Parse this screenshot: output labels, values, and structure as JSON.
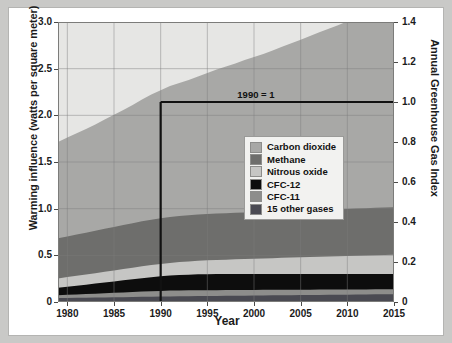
{
  "chart_data": {
    "type": "area",
    "title": "",
    "xlabel": "Year",
    "ylabel": "Warming influence (watts per square meter)",
    "ylabel_right": "Annual Greenhouse Gas Index",
    "xlim": [
      1979,
      2015
    ],
    "ylim": [
      0,
      3.0
    ],
    "ylim_right": [
      0,
      1.4
    ],
    "grid": true,
    "legend_position": "center-right",
    "stacked": true,
    "xticks": [
      1980,
      1985,
      1990,
      1995,
      2000,
      2005,
      2010,
      2015
    ],
    "xticklabels": [
      "1980",
      "1985",
      "1990",
      "1995",
      "2000",
      "2005",
      "2010",
      "2015"
    ],
    "yticks": [
      0,
      0.5,
      1.0,
      1.5,
      2.0,
      2.5,
      3.0
    ],
    "yticklabels": [
      "0",
      "0.5",
      "1.0",
      "1.5",
      "2.0",
      "2.5",
      "3.0"
    ],
    "yticks_right": [
      0,
      0.2,
      0.4,
      0.6,
      0.8,
      1.0,
      1.2,
      1.4
    ],
    "yticklabels_right": [
      "0",
      "0.2",
      "0.4",
      "0.6",
      "0.8",
      "1.0",
      "1.2",
      "1.4"
    ],
    "x": [
      1979,
      1980,
      1981,
      1982,
      1983,
      1984,
      1985,
      1986,
      1987,
      1988,
      1989,
      1990,
      1991,
      1992,
      1993,
      1994,
      1995,
      1996,
      1997,
      1998,
      1999,
      2000,
      2001,
      2002,
      2003,
      2004,
      2005,
      2006,
      2007,
      2008,
      2009,
      2010,
      2011,
      2012,
      2013,
      2014,
      2015
    ],
    "series": [
      {
        "name": "15 other gases",
        "color": "#4a4a52",
        "values": [
          0.043,
          0.044,
          0.045,
          0.046,
          0.047,
          0.049,
          0.05,
          0.052,
          0.053,
          0.055,
          0.057,
          0.058,
          0.06,
          0.061,
          0.062,
          0.063,
          0.064,
          0.065,
          0.066,
          0.067,
          0.068,
          0.069,
          0.07,
          0.071,
          0.072,
          0.073,
          0.074,
          0.075,
          0.076,
          0.077,
          0.078,
          0.079,
          0.08,
          0.081,
          0.082,
          0.083,
          0.084
        ]
      },
      {
        "name": "CFC-11",
        "color": "#8d8d8b",
        "values": [
          0.03,
          0.033,
          0.036,
          0.039,
          0.042,
          0.045,
          0.048,
          0.051,
          0.054,
          0.057,
          0.059,
          0.061,
          0.062,
          0.063,
          0.063,
          0.063,
          0.063,
          0.062,
          0.062,
          0.061,
          0.061,
          0.06,
          0.06,
          0.059,
          0.059,
          0.058,
          0.058,
          0.057,
          0.057,
          0.056,
          0.056,
          0.055,
          0.055,
          0.054,
          0.054,
          0.053,
          0.053
        ]
      },
      {
        "name": "CFC-12",
        "color": "#0d0d0d",
        "values": [
          0.08,
          0.087,
          0.094,
          0.101,
          0.108,
          0.115,
          0.122,
          0.129,
          0.136,
          0.143,
          0.15,
          0.156,
          0.161,
          0.165,
          0.168,
          0.17,
          0.171,
          0.172,
          0.172,
          0.172,
          0.172,
          0.172,
          0.171,
          0.171,
          0.17,
          0.17,
          0.169,
          0.169,
          0.168,
          0.167,
          0.167,
          0.166,
          0.165,
          0.165,
          0.164,
          0.163,
          0.162
        ]
      },
      {
        "name": "Nitrous oxide",
        "color": "#c6c6c4",
        "values": [
          0.1,
          0.103,
          0.106,
          0.109,
          0.112,
          0.115,
          0.118,
          0.121,
          0.124,
          0.127,
          0.13,
          0.133,
          0.136,
          0.139,
          0.142,
          0.145,
          0.148,
          0.151,
          0.154,
          0.157,
          0.16,
          0.163,
          0.166,
          0.169,
          0.172,
          0.175,
          0.178,
          0.181,
          0.184,
          0.187,
          0.19,
          0.193,
          0.196,
          0.199,
          0.202,
          0.205,
          0.208
        ]
      },
      {
        "name": "Methane",
        "color": "#6e6e6c",
        "values": [
          0.43,
          0.436,
          0.442,
          0.448,
          0.454,
          0.46,
          0.466,
          0.472,
          0.477,
          0.482,
          0.486,
          0.489,
          0.492,
          0.494,
          0.495,
          0.496,
          0.497,
          0.498,
          0.498,
          0.499,
          0.499,
          0.499,
          0.499,
          0.499,
          0.499,
          0.499,
          0.499,
          0.5,
          0.501,
          0.502,
          0.503,
          0.504,
          0.505,
          0.506,
          0.507,
          0.508,
          0.509
        ]
      },
      {
        "name": "Carbon dioxide",
        "color": "#a8a8a6",
        "values": [
          1.03,
          1.06,
          1.085,
          1.11,
          1.14,
          1.172,
          1.203,
          1.233,
          1.268,
          1.305,
          1.34,
          1.372,
          1.402,
          1.425,
          1.448,
          1.478,
          1.51,
          1.542,
          1.57,
          1.6,
          1.632,
          1.662,
          1.692,
          1.725,
          1.762,
          1.798,
          1.832,
          1.868,
          1.905,
          1.94,
          1.972,
          2.01,
          2.046,
          2.082,
          2.118,
          2.155,
          2.195
        ]
      }
    ],
    "annotations": [
      {
        "text": "1990 = 1",
        "x": 2000,
        "y": 1.0,
        "description": "reference line at index 1.0 from 1990 to 2015, with vertical drop at 1990"
      }
    ],
    "reference_line": {
      "label": "1990 = 1",
      "index_value": 1.0,
      "baseline_year": 1990,
      "color": "#111111"
    }
  },
  "legend": {
    "items": [
      {
        "label": "Carbon dioxide",
        "color": "#a8a8a6"
      },
      {
        "label": "Methane",
        "color": "#6e6e6c"
      },
      {
        "label": "Nitrous oxide",
        "color": "#c6c6c4"
      },
      {
        "label": "CFC-12",
        "color": "#0d0d0d"
      },
      {
        "label": "CFC-11",
        "color": "#8d8d8b"
      },
      {
        "label": "15 other gases",
        "color": "#4a4a52"
      }
    ]
  }
}
